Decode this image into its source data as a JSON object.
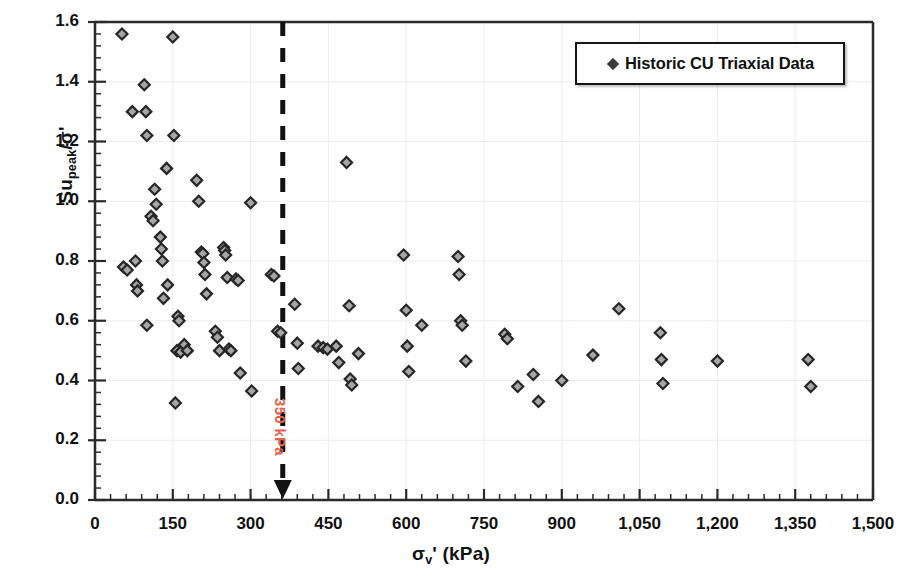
{
  "chart_data": {
    "type": "scatter",
    "title": "",
    "xlabel": "σv' (kPa)",
    "xlabel_parts": {
      "sigma": "σ",
      "sub": "v",
      "prime_unit": "' (kPa)"
    },
    "ylabel": "Supeak/σ'",
    "ylabel_parts": {
      "su": "Su",
      "sub": "peak",
      "rest": "/σ'"
    },
    "xlim": [
      0,
      1500
    ],
    "ylim": [
      0.0,
      1.6
    ],
    "xticks": [
      0,
      150,
      300,
      450,
      600,
      750,
      900,
      1050,
      1200,
      1350,
      1500
    ],
    "xtick_labels": [
      "0",
      "150",
      "300",
      "450",
      "600",
      "750",
      "900",
      "1,050",
      "1,200",
      "1,350",
      "1,500"
    ],
    "yticks": [
      0.0,
      0.2,
      0.4,
      0.6,
      0.8,
      1.0,
      1.2,
      1.4,
      1.6
    ],
    "ytick_labels": [
      "0.0",
      "0.2",
      "0.4",
      "0.6",
      "0.8",
      "1.0",
      "1.2",
      "1.4",
      "1.6"
    ],
    "x_minor_per_major": 5,
    "y_minor_per_major": 5,
    "grid": true,
    "grid_color": "#e9ecf2",
    "legend_position": "top-right",
    "marker": {
      "shape": "diamond",
      "fill": "#a6a6a6",
      "edge": "#262626",
      "size": 11
    },
    "series": [
      {
        "name": "Historic CU Triaxial Data",
        "points": [
          [
            52,
            1.56
          ],
          [
            55,
            0.78
          ],
          [
            62,
            0.77
          ],
          [
            72,
            1.3
          ],
          [
            78,
            0.8
          ],
          [
            80,
            0.72
          ],
          [
            82,
            0.7
          ],
          [
            95,
            1.39
          ],
          [
            98,
            1.3
          ],
          [
            100,
            1.22
          ],
          [
            100,
            0.585
          ],
          [
            108,
            0.95
          ],
          [
            112,
            0.935
          ],
          [
            115,
            1.04
          ],
          [
            118,
            0.99
          ],
          [
            126,
            0.88
          ],
          [
            128,
            0.84
          ],
          [
            130,
            0.8
          ],
          [
            132,
            0.675
          ],
          [
            138,
            1.11
          ],
          [
            140,
            0.72
          ],
          [
            150,
            1.55
          ],
          [
            152,
            1.22
          ],
          [
            155,
            0.325
          ],
          [
            158,
            0.5
          ],
          [
            160,
            0.615
          ],
          [
            162,
            0.6
          ],
          [
            165,
            0.495
          ],
          [
            172,
            0.52
          ],
          [
            178,
            0.5
          ],
          [
            196,
            1.07
          ],
          [
            200,
            1.0
          ],
          [
            205,
            0.83
          ],
          [
            208,
            0.825
          ],
          [
            210,
            0.795
          ],
          [
            212,
            0.755
          ],
          [
            215,
            0.69
          ],
          [
            232,
            0.565
          ],
          [
            236,
            0.545
          ],
          [
            240,
            0.5
          ],
          [
            248,
            0.845
          ],
          [
            250,
            0.835
          ],
          [
            252,
            0.82
          ],
          [
            255,
            0.745
          ],
          [
            258,
            0.505
          ],
          [
            262,
            0.5
          ],
          [
            272,
            0.74
          ],
          [
            276,
            0.735
          ],
          [
            280,
            0.425
          ],
          [
            300,
            0.995
          ],
          [
            302,
            0.365
          ],
          [
            340,
            0.755
          ],
          [
            345,
            0.75
          ],
          [
            352,
            0.565
          ],
          [
            358,
            0.56
          ],
          [
            385,
            0.655
          ],
          [
            390,
            0.525
          ],
          [
            392,
            0.44
          ],
          [
            430,
            0.515
          ],
          [
            440,
            0.51
          ],
          [
            448,
            0.505
          ],
          [
            465,
            0.515
          ],
          [
            470,
            0.46
          ],
          [
            485,
            1.13
          ],
          [
            490,
            0.65
          ],
          [
            492,
            0.405
          ],
          [
            495,
            0.385
          ],
          [
            508,
            0.49
          ],
          [
            595,
            0.82
          ],
          [
            600,
            0.635
          ],
          [
            602,
            0.515
          ],
          [
            605,
            0.43
          ],
          [
            630,
            0.585
          ],
          [
            700,
            0.815
          ],
          [
            702,
            0.755
          ],
          [
            705,
            0.6
          ],
          [
            708,
            0.585
          ],
          [
            715,
            0.465
          ],
          [
            790,
            0.555
          ],
          [
            795,
            0.54
          ],
          [
            815,
            0.38
          ],
          [
            845,
            0.42
          ],
          [
            855,
            0.33
          ],
          [
            900,
            0.4
          ],
          [
            960,
            0.485
          ],
          [
            1010,
            0.64
          ],
          [
            1090,
            0.56
          ],
          [
            1092,
            0.47
          ],
          [
            1095,
            0.39
          ],
          [
            1200,
            0.465
          ],
          [
            1375,
            0.47
          ],
          [
            1380,
            0.38
          ]
        ]
      }
    ],
    "annotations": [
      {
        "type": "vertical-dashed-line-with-arrow",
        "x": 362,
        "label": "350 kPa",
        "color": "#E8604C",
        "line_color": "#111111"
      }
    ]
  },
  "legend": {
    "label": "Historic CU Triaxial Data",
    "marker_shape": "diamond"
  },
  "annotation": {
    "label": "350 kPa"
  }
}
